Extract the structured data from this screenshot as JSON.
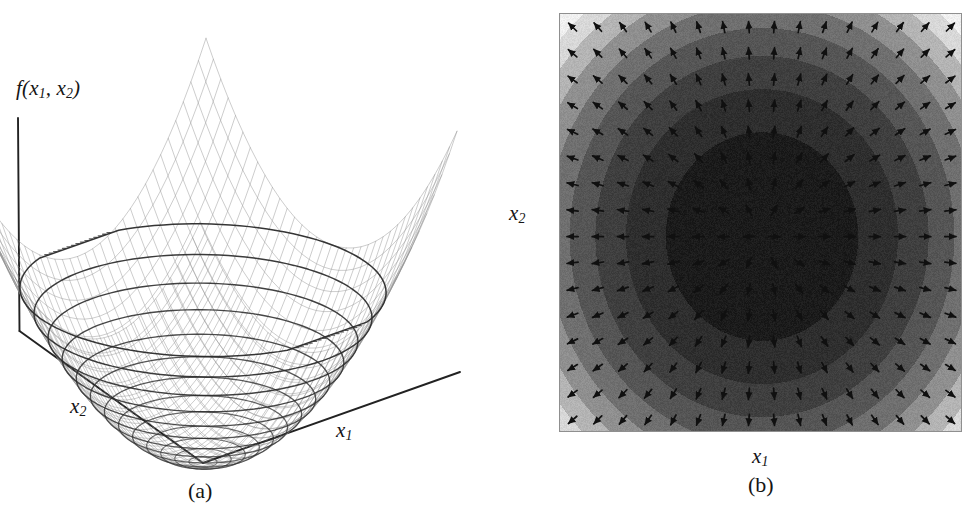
{
  "figure": {
    "background": "#ffffff",
    "width": 976,
    "height": 518,
    "ink_color": "#151515"
  },
  "panel_a": {
    "caption": "(a)",
    "vertical_axis_label": "f(x",
    "vertical_axis_label_sub1": "1",
    "vertical_axis_label_mid": ", x",
    "vertical_axis_label_sub2": "2",
    "vertical_axis_label_end": ")",
    "x1_axis_label": "x",
    "x1_axis_sub": "1",
    "x2_axis_label": "x",
    "x2_axis_sub": "2",
    "plot_type": "3d-wireframe-surface",
    "description": "Quadratic bowl (paraboloid) drawn as a wireframe mesh with contour rings on the surface",
    "mesh_color": "#8c8c8c",
    "contour_color": "#2a2a2a",
    "axis_color": "#222222"
  },
  "panel_b": {
    "caption": "(b)",
    "x1_axis_label": "x",
    "x1_axis_sub": "1",
    "x2_axis_label": "x",
    "x2_axis_sub": "2",
    "plot_type": "filled-contour-with-gradient-arrows",
    "description": "Grayscale filled contour map of the same quadratic with a 16 by 16 grid of gradient arrows pointing away from the minimum",
    "arrow_color": "#101010",
    "frame_color": "#8f8f8f",
    "arrow_grid_cols": 16,
    "arrow_grid_rows": 16
  },
  "chart_data": {
    "type": "surface",
    "title": "",
    "subtitle": "",
    "panels": [
      {
        "id": "a",
        "caption": "(a)",
        "type": "surface",
        "xlabel": "x1",
        "ylabel": "x2",
        "zlabel": "f(x1, x2)",
        "function": "quadratic bowl: f(x1,x2) = a*x1^2 + b*x2^2",
        "xlim": [
          -3,
          3
        ],
        "ylim": [
          -3,
          3
        ],
        "zlim": [
          0,
          18
        ],
        "mesh_nx": 34,
        "mesh_ny": 34,
        "contour_levels": [
          0.5,
          1.5,
          3,
          5,
          7.5,
          10.5,
          14,
          18
        ],
        "grid": false,
        "legend": "none",
        "minimum_at": [
          0,
          0
        ],
        "minimum_value": 0
      },
      {
        "id": "b",
        "caption": "(b)",
        "type": "heatmap",
        "xlabel": "x1",
        "ylabel": "x2",
        "xlim": [
          -3,
          3
        ],
        "ylim": [
          -3,
          3
        ],
        "grid": false,
        "legend": "none",
        "colormap": "grayscale-banded-inverted",
        "band_count": 9,
        "band_levels": [
          0,
          2,
          4,
          6,
          8,
          10,
          12,
          14,
          16,
          18
        ],
        "band_colors": [
          "#1b1b1b",
          "#2e2e2e",
          "#3f3f3f",
          "#555555",
          "#6f6f6f",
          "#8f8f8f",
          "#b4b4b4",
          "#d8d8d8",
          "#f0f0f0",
          "#c0c0c0"
        ],
        "overlay": "gradient-vector-field",
        "vector_field": "grad f(x1,x2), arrows point uphill away from the minimum",
        "vector_grid": [
          16,
          16
        ],
        "minimum_at": [
          0,
          0
        ],
        "minimum_value": 0
      }
    ]
  }
}
